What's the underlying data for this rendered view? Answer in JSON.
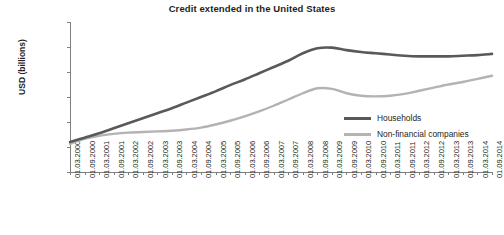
{
  "chart_data": {
    "type": "line",
    "title": "Credit extended in the United States",
    "xlabel": "",
    "ylabel": "USD (billions)",
    "ylim": [
      4000,
      16000
    ],
    "yticks": [
      4000,
      6000,
      8000,
      10000,
      12000,
      14000,
      16000
    ],
    "ytick_labels": [
      "4,000",
      "6,000",
      "8,000",
      "10,000",
      "12,000",
      "14,000",
      "16,000"
    ],
    "grid": false,
    "legend_position": "inside-right",
    "categories": [
      "01.03.2000",
      "01.09.2000",
      "01.03.2001",
      "01.09.2001",
      "01.03.2002",
      "01.09.2002",
      "01.03.2003",
      "01.09.2003",
      "01.03.2004",
      "01.09.2004",
      "01.03.2005",
      "01.09.2005",
      "01.03.2006",
      "01.09.2006",
      "01.03.2007",
      "01.09.2007",
      "01.03.2008",
      "01.09.2008",
      "01.03.2009",
      "01.09.2009",
      "01.03.2010",
      "01.09.2010",
      "01.03.2011",
      "01.09.2011",
      "01.03.2012",
      "01.09.2012",
      "01.03.2013",
      "01.09.2013",
      "01.03.2014",
      "01.09.2014"
    ],
    "series": [
      {
        "name": "Households",
        "color": "#595959",
        "values": [
          6400,
          6750,
          7100,
          7500,
          7900,
          8300,
          8700,
          9100,
          9550,
          10000,
          10450,
          10950,
          11400,
          11900,
          12400,
          12900,
          13500,
          13900,
          13950,
          13750,
          13600,
          13500,
          13400,
          13300,
          13250,
          13250,
          13250,
          13300,
          13350,
          13450
        ]
      },
      {
        "name": "Non-financial companies",
        "color": "#b3b3b3",
        "values": [
          6250,
          6650,
          6900,
          7050,
          7150,
          7200,
          7250,
          7300,
          7400,
          7550,
          7800,
          8100,
          8450,
          8850,
          9300,
          9800,
          10300,
          10700,
          10650,
          10300,
          10100,
          10050,
          10100,
          10250,
          10500,
          10750,
          11000,
          11200,
          11450,
          11700
        ]
      }
    ]
  }
}
